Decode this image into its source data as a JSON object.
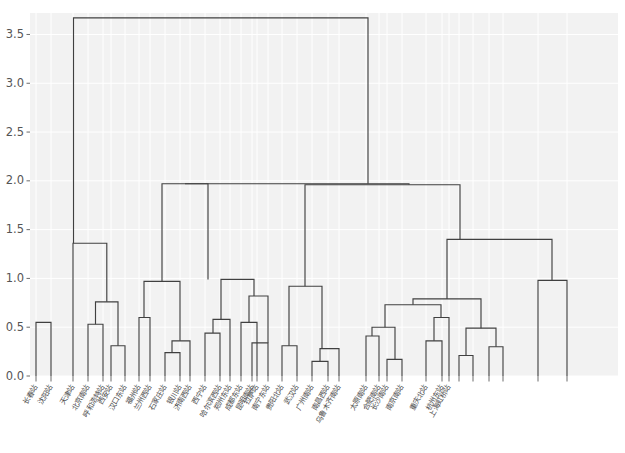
{
  "chart_data": {
    "type": "dendrogram",
    "title": "",
    "xlabel": "",
    "ylabel": "",
    "ylim": [
      0,
      3.72
    ],
    "yticks": [
      0.0,
      0.5,
      1.0,
      1.5,
      2.0,
      2.5,
      3.0,
      3.5
    ],
    "ytick_labels": [
      "0.0",
      "0.5",
      "1.0",
      "1.5",
      "2.0",
      "2.5",
      "3.0",
      "3.5"
    ],
    "grid": true,
    "grid_color": "#ffffff",
    "axes_facecolor": "#f2f2f2",
    "link_color": "#404040",
    "leaf_rotation": 60,
    "n_leaves": 36,
    "leaf_labels": [
      "长春站",
      "沈阳站",
      "天津站",
      "北京南站",
      "呼和浩特站",
      "西安站",
      "汉口东站",
      "福州站",
      "兰州西站",
      "石家庄站",
      "银川站",
      "济南西站",
      "西宁站",
      "哈尔滨西站",
      "郑州东站",
      "成都东站",
      "拉萨站",
      "昆明南站",
      "南宁东站",
      "贵阳北站",
      "武汉站",
      "广州南站",
      "南昌西站",
      "乌鲁木齐南站",
      "太原南站",
      "合肥南站",
      "长沙南站",
      "南京南站",
      "重庆北站",
      "杭州东站",
      "上海虹桥站"
    ],
    "merges": [
      {
        "id": "m1",
        "x": 43.5,
        "height": 0.55,
        "left": {
          "x": 36,
          "h": 0
        },
        "right": {
          "x": 51,
          "h": 0
        }
      },
      {
        "id": "m2",
        "x": 95.5,
        "height": 0.53,
        "left": {
          "x": 88,
          "h": 0
        },
        "right": {
          "x": 103,
          "h": 0
        }
      },
      {
        "id": "m3",
        "x": 118,
        "height": 0.31,
        "left": {
          "x": 111,
          "h": 0
        },
        "right": {
          "x": 125,
          "h": 0
        }
      },
      {
        "id": "m4",
        "x": 106.8,
        "height": 0.76,
        "left": {
          "x": 95.5,
          "h": 0.53
        },
        "right": {
          "x": 118,
          "h": 0.31
        }
      },
      {
        "id": "m5",
        "x": 89.5,
        "height": 1.36,
        "left": {
          "x": 73,
          "h": 0
        },
        "right": {
          "x": 106.8,
          "h": 0.76
        }
      },
      {
        "id": "m6",
        "x": 144,
        "height": 0.6,
        "left": {
          "x": 139,
          "h": 0
        },
        "right": {
          "x": 150,
          "h": 0
        }
      },
      {
        "id": "m7",
        "x": 172,
        "height": 0.24,
        "left": {
          "x": 165,
          "h": 0
        },
        "right": {
          "x": 180,
          "h": 0
        }
      },
      {
        "id": "m8",
        "x": 180,
        "height": 0.36,
        "left": {
          "x": 172,
          "h": 0.24
        },
        "right": {
          "x": 190,
          "h": 0
        }
      },
      {
        "id": "m9",
        "x": 162,
        "height": 0.97,
        "left": {
          "x": 144,
          "h": 0.6
        },
        "right": {
          "x": 180,
          "h": 0.36
        }
      },
      {
        "id": "m10",
        "x": 213,
        "height": 0.44,
        "left": {
          "x": 205,
          "h": 0
        },
        "right": {
          "x": 220,
          "h": 0
        }
      },
      {
        "id": "m11",
        "x": 221,
        "height": 0.58,
        "left": {
          "x": 213,
          "h": 0.44
        },
        "right": {
          "x": 230,
          "h": 0
        }
      },
      {
        "id": "m12",
        "x": 249,
        "height": 0.55,
        "left": {
          "x": 241,
          "h": 0
        },
        "right": {
          "x": 257,
          "h": 0
        }
      },
      {
        "id": "m13",
        "x": 260,
        "height": 0.34,
        "left": {
          "x": 252,
          "h": 0
        },
        "right": {
          "x": 268,
          "h": 0
        }
      },
      {
        "id": "m14",
        "x": 254,
        "height": 0.82,
        "left": {
          "x": 249,
          "h": 0.55
        },
        "right": {
          "x": 268,
          "h": 0.34
        }
      },
      {
        "id": "m15",
        "x": 208,
        "height": 0.99,
        "left": {
          "x": 221,
          "h": 0.58
        },
        "right": {
          "x": 254,
          "h": 0.82
        }
      },
      {
        "id": "m16",
        "x": 185,
        "height": 1.97,
        "left": {
          "x": 162,
          "h": 0.97
        },
        "right": {
          "x": 208,
          "h": 0.99
        }
      },
      {
        "id": "m17",
        "x": 289,
        "height": 0.31,
        "left": {
          "x": 282,
          "h": 0
        },
        "right": {
          "x": 297,
          "h": 0
        }
      },
      {
        "id": "m18",
        "x": 320,
        "height": 0.15,
        "left": {
          "x": 312,
          "h": 0
        },
        "right": {
          "x": 328,
          "h": 0
        }
      },
      {
        "id": "m19",
        "x": 322,
        "height": 0.28,
        "left": {
          "x": 320,
          "h": 0.15
        },
        "right": {
          "x": 339,
          "h": 0
        }
      },
      {
        "id": "m20",
        "x": 305,
        "height": 0.92,
        "left": {
          "x": 289,
          "h": 0.31
        },
        "right": {
          "x": 322,
          "h": 0.28
        }
      },
      {
        "id": "m21",
        "x": 372,
        "height": 0.41,
        "left": {
          "x": 366,
          "h": 0
        },
        "right": {
          "x": 379,
          "h": 0
        }
      },
      {
        "id": "m22",
        "x": 395,
        "height": 0.17,
        "left": {
          "x": 387,
          "h": 0
        },
        "right": {
          "x": 402,
          "h": 0
        }
      },
      {
        "id": "m23",
        "x": 385,
        "height": 0.5,
        "left": {
          "x": 372,
          "h": 0.41
        },
        "right": {
          "x": 395,
          "h": 0.17
        }
      },
      {
        "id": "m24",
        "x": 434,
        "height": 0.36,
        "left": {
          "x": 426,
          "h": 0
        },
        "right": {
          "x": 442,
          "h": 0
        }
      },
      {
        "id": "m25",
        "x": 441,
        "height": 0.6,
        "left": {
          "x": 434,
          "h": 0.36
        },
        "right": {
          "x": 449,
          "h": 0
        }
      },
      {
        "id": "m26",
        "x": 413,
        "height": 0.73,
        "left": {
          "x": 385,
          "h": 0.5
        },
        "right": {
          "x": 441,
          "h": 0.6
        }
      },
      {
        "id": "m27",
        "x": 466,
        "height": 0.21,
        "left": {
          "x": 459,
          "h": 0
        },
        "right": {
          "x": 473,
          "h": 0
        }
      },
      {
        "id": "m28",
        "x": 496,
        "height": 0.3,
        "left": {
          "x": 489,
          "h": 0
        },
        "right": {
          "x": 503,
          "h": 0
        }
      },
      {
        "id": "m29",
        "x": 481,
        "height": 0.49,
        "left": {
          "x": 466,
          "h": 0.21
        },
        "right": {
          "x": 496,
          "h": 0.3
        }
      },
      {
        "id": "m30",
        "x": 447,
        "height": 0.79,
        "left": {
          "x": 413,
          "h": 0.73
        },
        "right": {
          "x": 481,
          "h": 0.49
        }
      },
      {
        "id": "m31",
        "x": 460,
        "height": 1.4,
        "left": {
          "x": 447,
          "h": 0.79
        },
        "right": {
          "x": 552,
          "h": 0.98
        }
      },
      {
        "id": "m32",
        "x": 545,
        "height": 0.98,
        "left": {
          "x": 538,
          "h": 0
        },
        "right": {
          "x": 567,
          "h": 0
        }
      },
      {
        "id": "m33",
        "x": 409,
        "height": 1.96,
        "left": {
          "x": 305,
          "h": 0.92
        },
        "right": {
          "x": 460,
          "h": 1.4
        }
      },
      {
        "id": "m34",
        "x": 368,
        "height": 1.97,
        "left": {
          "x": 185,
          "h": 1.97
        },
        "right": {
          "x": 409,
          "h": 1.96
        }
      },
      {
        "id": "m35",
        "x": 220,
        "height": 3.67,
        "left": {
          "x": 73.5,
          "h": 1.36
        },
        "right": {
          "x": 368,
          "h": 1.97
        }
      }
    ],
    "leaf_x_positions": [
      36,
      51,
      73,
      88,
      103,
      111,
      125,
      139,
      150,
      165,
      180,
      190,
      205,
      220,
      230,
      241,
      257,
      252,
      268,
      282,
      297,
      312,
      328,
      339,
      366,
      379,
      387,
      402,
      426,
      442,
      449,
      459,
      473,
      489,
      503,
      538,
      567
    ]
  },
  "axes": {
    "y_axis_name": "merge-distance-axis",
    "x_axis_name": "station-leaf-axis"
  }
}
